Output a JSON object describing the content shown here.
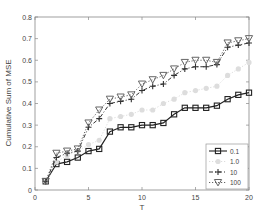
{
  "chart_data": {
    "type": "line",
    "title": "",
    "xlabel": "T",
    "ylabel": "Cumulative Sum of MSE",
    "xlim": [
      0,
      20
    ],
    "ylim": [
      0,
      0.8
    ],
    "xticks": [
      0,
      5,
      10,
      15,
      20
    ],
    "yticks": [
      0,
      0.1,
      0.2,
      0.3,
      0.4,
      0.5,
      0.6,
      0.7,
      0.8
    ],
    "grid": false,
    "legend_position": "lower right",
    "x": [
      1,
      2,
      3,
      4,
      5,
      6,
      7,
      8,
      9,
      10,
      11,
      12,
      13,
      14,
      15,
      16,
      17,
      18,
      19,
      20
    ],
    "series": [
      {
        "name": "0.1",
        "marker": "square",
        "line_style": "solid",
        "color": "#222222",
        "values": [
          0.04,
          0.12,
          0.13,
          0.15,
          0.18,
          0.19,
          0.27,
          0.29,
          0.29,
          0.3,
          0.3,
          0.31,
          0.35,
          0.38,
          0.38,
          0.38,
          0.39,
          0.42,
          0.44,
          0.45
        ]
      },
      {
        "name": "1.0",
        "marker": "circle",
        "line_style": "dotted",
        "color": "#dddddd",
        "values": [
          0.04,
          0.13,
          0.16,
          0.18,
          0.21,
          0.23,
          0.33,
          0.34,
          0.35,
          0.37,
          0.37,
          0.4,
          0.42,
          0.45,
          0.46,
          0.47,
          0.48,
          0.53,
          0.56,
          0.59
        ]
      },
      {
        "name": "10",
        "marker": "plus",
        "line_style": "dashdot",
        "color": "#333333",
        "values": [
          0.04,
          0.15,
          0.17,
          0.18,
          0.29,
          0.33,
          0.4,
          0.41,
          0.42,
          0.46,
          0.48,
          0.49,
          0.53,
          0.56,
          0.57,
          0.57,
          0.58,
          0.66,
          0.67,
          0.68
        ]
      },
      {
        "name": "100",
        "marker": "triangle-down",
        "line_style": "dotted",
        "color": "#666666",
        "values": [
          0.04,
          0.17,
          0.18,
          0.19,
          0.31,
          0.37,
          0.42,
          0.43,
          0.44,
          0.49,
          0.51,
          0.53,
          0.56,
          0.59,
          0.6,
          0.6,
          0.59,
          0.68,
          0.69,
          0.7
        ]
      }
    ]
  }
}
